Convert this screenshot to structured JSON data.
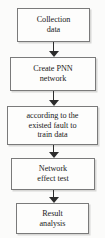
{
  "diagram": {
    "orientation": "vertical-top-down",
    "background_color": "#fbfbfa",
    "node_fill_color": "#fdfdfc",
    "node_border_color": "#7a7a7a",
    "arrow_color": "#2c2c2c",
    "text_color": "#1b1b1b",
    "nodes": [
      {
        "id": "collection-data",
        "label": "Collection\ndata"
      },
      {
        "id": "create-pnn-network",
        "label": "Create PNN\nnetwork"
      },
      {
        "id": "train-data",
        "label": "according to the\nexisted fault to\ntrain data"
      },
      {
        "id": "network-effect-test",
        "label": "Network\neffect test"
      },
      {
        "id": "result-analysis",
        "label": "Result\nanalysis"
      }
    ],
    "connectors": [
      {
        "id": "arrow-0",
        "from": "collection-data",
        "to": "create-pnn-network",
        "marker": "arrowhead-down"
      },
      {
        "id": "arrow-1",
        "from": "create-pnn-network",
        "to": "train-data",
        "marker": "arrowhead-down"
      },
      {
        "id": "arrow-2",
        "from": "train-data",
        "to": "network-effect-test",
        "marker": "arrowhead-down"
      },
      {
        "id": "arrow-3",
        "from": "network-effect-test",
        "to": "result-analysis",
        "marker": "arrowhead-down"
      }
    ]
  }
}
